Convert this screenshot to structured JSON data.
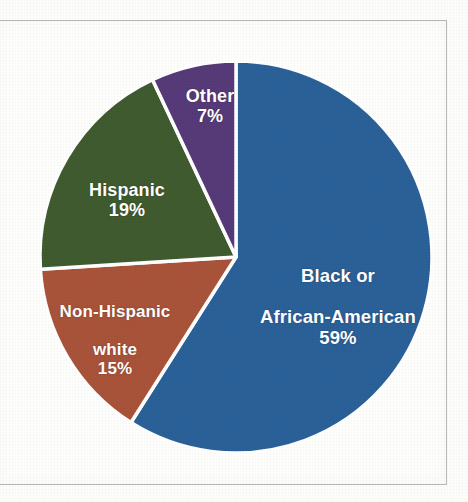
{
  "chart_data": {
    "type": "pie",
    "title": "",
    "subtitle": "",
    "xlabel": "",
    "ylabel": "",
    "legend_position": "none",
    "labels_inside_slices": true,
    "start_angle_deg": 0,
    "direction": "clockwise",
    "categories": [
      "Black or African-American",
      "Non-Hispanic white",
      "Hispanic",
      "Other"
    ],
    "values": [
      59,
      15,
      19,
      7
    ],
    "units": "%",
    "slices": [
      {
        "name": "Black or African-American",
        "label_line1": "Black or",
        "label_line2": "African-American",
        "value": 59,
        "value_label": "59%",
        "color": "#2B6199",
        "start_deg": 0,
        "end_deg": 212.4
      },
      {
        "name": "Non-Hispanic white",
        "label_line1": "Non-Hispanic",
        "label_line2": "white",
        "value": 15,
        "value_label": "15%",
        "color": "#A9543A",
        "start_deg": 212.4,
        "end_deg": 266.4
      },
      {
        "name": "Hispanic",
        "label_line1": "Hispanic",
        "label_line2": "",
        "value": 19,
        "value_label": "19%",
        "color": "#3F5B2F",
        "start_deg": 266.4,
        "end_deg": 334.8
      },
      {
        "name": "Other",
        "label_line1": "Other",
        "label_line2": "",
        "value": 7,
        "value_label": "7%",
        "color": "#573A78",
        "start_deg": 334.8,
        "end_deg": 360
      }
    ],
    "slice_separator_color": "#ffffff",
    "label_text_color": "#ffffff",
    "background_color": "#fefefd",
    "frame_border_color": "#b9b9b4"
  }
}
